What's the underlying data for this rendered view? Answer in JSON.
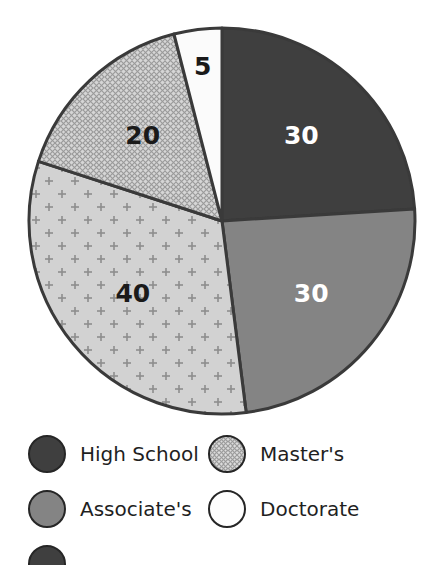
{
  "chart_data": {
    "type": "pie",
    "title": "",
    "subtitle": "",
    "xlabel": "",
    "ylabel": "",
    "grid": false,
    "legend_position": "bottom",
    "total": 125,
    "start_angle_deg": 0,
    "direction": "clockwise",
    "categories": [
      "High School",
      "Associate's",
      "Bachelor's",
      "Master's",
      "Doctorate"
    ],
    "values": [
      30,
      30,
      40,
      20,
      5
    ],
    "slices": [
      {
        "label": "High School",
        "value": 30,
        "value_text": "30",
        "fill": "#3f3f3f",
        "pattern": "solid",
        "label_color": "#ffffff",
        "start_deg": 0,
        "end_deg": 86.4
      },
      {
        "label": "Associate's",
        "value": 30,
        "value_text": "30",
        "fill": "#848484",
        "pattern": "solid",
        "label_color": "#ffffff",
        "start_deg": 86.4,
        "end_deg": 172.8
      },
      {
        "label": "Bachelor's",
        "value": 40,
        "value_text": "40",
        "fill": "#d2d2d2",
        "pattern": "plus-marks",
        "label_color": "#1a1a1a",
        "start_deg": 172.8,
        "end_deg": 288.0
      },
      {
        "label": "Master's",
        "value": 20,
        "value_text": "20",
        "fill": "#d6d6d6",
        "pattern": "crosshatch",
        "label_color": "#1a1a1a",
        "start_deg": 288.0,
        "end_deg": 345.6
      },
      {
        "label": "Doctorate",
        "value": 5,
        "value_text": "5",
        "fill": "#fbfbfb",
        "pattern": "solid",
        "label_color": "#1a1a1a",
        "start_deg": 345.6,
        "end_deg": 360.0
      }
    ],
    "value_labels": [
      "30",
      "30",
      "40",
      "20",
      "5"
    ],
    "geometry": {
      "center_x": 222,
      "center_y": 221,
      "radius": 193,
      "outline_color": "#3a3a3a",
      "outline_width": 3
    }
  },
  "legend": {
    "rows": [
      {
        "items": [
          {
            "label": "High School",
            "swatch": "solid-dark",
            "fill": "#3f3f3f",
            "pattern": "solid"
          },
          {
            "label": "Master's",
            "swatch": "crosshatch",
            "fill": "#d6d6d6",
            "pattern": "crosshatch"
          }
        ]
      },
      {
        "items": [
          {
            "label": "Associate's",
            "swatch": "solid-gray",
            "fill": "#848484",
            "pattern": "solid"
          },
          {
            "label": "Doctorate",
            "swatch": "solid-white",
            "fill": "#fefefe",
            "pattern": "solid"
          }
        ]
      },
      {
        "items": [
          {
            "label": "",
            "swatch": "solid-dark",
            "fill": "#3f3f3f",
            "pattern": "solid"
          }
        ]
      }
    ]
  },
  "colors": {
    "background": "#ffffff",
    "outline": "#3a3a3a",
    "text": "#1f1f1f",
    "label_light": "#ffffff",
    "label_dark": "#1a1a1a",
    "slice_dark": "#3f3f3f",
    "slice_gray": "#848484",
    "slice_light": "#d2d2d2",
    "slice_hatch": "#d6d6d6",
    "slice_white": "#fbfbfb"
  }
}
